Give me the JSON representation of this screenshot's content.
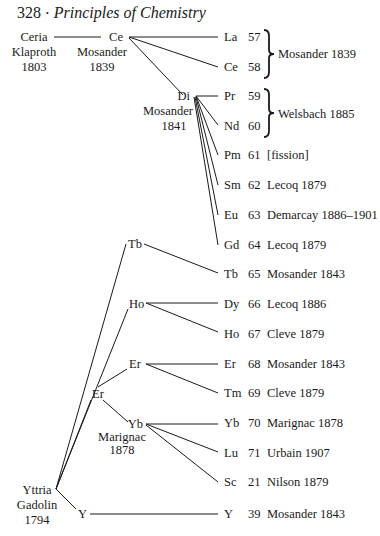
{
  "header": {
    "page_number": "328",
    "separator": "·",
    "book_title": "Principles of Chemistry"
  },
  "roots": {
    "ceria": {
      "lines": [
        "Ceria",
        "Klaproth",
        "1803"
      ]
    },
    "yttria": {
      "lines": [
        "Yttria",
        "Gadolin",
        "1794"
      ]
    }
  },
  "intermediates": {
    "ce": {
      "lines": [
        "Ce",
        "Mosander",
        "1839"
      ]
    },
    "di": {
      "lines": [
        "Di",
        "Mosander",
        "1841"
      ]
    },
    "tb": {
      "lines": [
        "Tb"
      ]
    },
    "ho": {
      "lines": [
        "Ho"
      ]
    },
    "er_mid": {
      "lines": [
        "Er"
      ]
    },
    "er_upper": {
      "lines": [
        "Er"
      ]
    },
    "yb": {
      "lines": [
        "Yb",
        "Marignac",
        "1878"
      ]
    },
    "y": {
      "lines": [
        "Y"
      ]
    }
  },
  "elements": [
    {
      "symbol": "La",
      "z": "57",
      "credit": ""
    },
    {
      "symbol": "Ce",
      "z": "58",
      "credit": ""
    },
    {
      "symbol": "Pr",
      "z": "59",
      "credit": ""
    },
    {
      "symbol": "Nd",
      "z": "60",
      "credit": ""
    },
    {
      "symbol": "Pm",
      "z": "61",
      "credit": "[fission]"
    },
    {
      "symbol": "Sm",
      "z": "62",
      "credit": "Lecoq 1879"
    },
    {
      "symbol": "Eu",
      "z": "63",
      "credit": "Demarcay 1886–1901"
    },
    {
      "symbol": "Gd",
      "z": "64",
      "credit": "Lecoq 1879"
    },
    {
      "symbol": "Tb",
      "z": "65",
      "credit": "Mosander 1843"
    },
    {
      "symbol": "Dy",
      "z": "66",
      "credit": "Lecoq 1886"
    },
    {
      "symbol": "Ho",
      "z": "67",
      "credit": "Cleve 1879"
    },
    {
      "symbol": "Er",
      "z": "68",
      "credit": "Mosander 1843"
    },
    {
      "symbol": "Tm",
      "z": "69",
      "credit": "Cleve 1879"
    },
    {
      "symbol": "Yb",
      "z": "70",
      "credit": "Marignac 1878"
    },
    {
      "symbol": "Lu",
      "z": "71",
      "credit": "Urbain 1907"
    },
    {
      "symbol": "Sc",
      "z": "21",
      "credit": "Nilson 1879"
    },
    {
      "symbol": "Y",
      "z": "39",
      "credit": "Mosander 1843"
    }
  ],
  "brackets": [
    {
      "label": "Mosander 1839"
    },
    {
      "label": "Welsbach 1885"
    }
  ]
}
